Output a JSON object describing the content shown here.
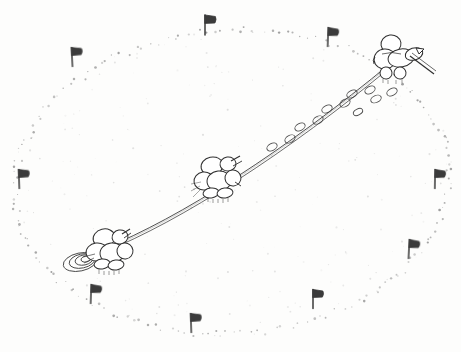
{
  "image": {
    "kind": "hand-drawn-pencil-sketch",
    "title": "Three figures hauling a tow-line across a flagged oval course",
    "medium": "graphite pencil on white paper",
    "background_color": "#fdfdfc",
    "ink_color": "#2a2a2a",
    "faint_color": "#9a9a9a",
    "width": 461,
    "height": 352,
    "orientation": "landscape"
  },
  "scene": {
    "description": "A large dotted ellipse marks out a ground course. Three small rounded humanoid figures are strung along a single taut double-line rope running from the lower-left to the upper-right. Small flag markers shaped like the letter P ring the ellipse. Oval footprints trail behind the leading figure.",
    "caption": "Three roped figures crossing a flag-marked oval",
    "perspective": "high oblique / bird's eye"
  },
  "course": {
    "name": "dotted-ellipse-course",
    "style": "stippled dotted outline",
    "center": {
      "x": 232,
      "y": 182
    },
    "radius_x": 218,
    "radius_y": 152,
    "rotation_deg": -4,
    "dot_count": 168,
    "dot_color": "#8d8d8d"
  },
  "flags": {
    "label": "course marker flags",
    "glyph": "P",
    "shape": "pole-with-pennant",
    "count": 9,
    "color": "#3a3a3a",
    "items": [
      {
        "id": "flag-top-left",
        "x": 72,
        "y": 57,
        "size": 19,
        "tilt": -3
      },
      {
        "id": "flag-top-center",
        "x": 205,
        "y": 25,
        "size": 20,
        "tilt": 0
      },
      {
        "id": "flag-top-right",
        "x": 328,
        "y": 37,
        "size": 19,
        "tilt": 2
      },
      {
        "id": "flag-left",
        "x": 19,
        "y": 179,
        "size": 19,
        "tilt": -2
      },
      {
        "id": "flag-right",
        "x": 435,
        "y": 179,
        "size": 19,
        "tilt": 1
      },
      {
        "id": "flag-lower-right",
        "x": 409,
        "y": 249,
        "size": 19,
        "tilt": 3
      },
      {
        "id": "flag-bottom-right",
        "x": 313,
        "y": 299,
        "size": 19,
        "tilt": 0
      },
      {
        "id": "flag-bottom-center",
        "x": 191,
        "y": 323,
        "size": 19,
        "tilt": -2
      },
      {
        "id": "flag-bottom-left",
        "x": 91,
        "y": 294,
        "size": 19,
        "tilt": 2
      }
    ]
  },
  "towline": {
    "label": "tow rope",
    "style": "double pencil line, taut",
    "from": {
      "x": 103,
      "y": 248
    },
    "to": {
      "x": 390,
      "y": 62
    },
    "color": "#3d3d3d"
  },
  "figures": {
    "label": "roped figures",
    "count": 3,
    "items": [
      {
        "id": "figure-lead",
        "position_label": "upper-right",
        "x": 392,
        "y": 60,
        "scale": 1.0,
        "holds": "long pole",
        "note": "leading figure, carries a long pole angled down-right"
      },
      {
        "id": "figure-middle",
        "position_label": "center",
        "x": 216,
        "y": 180,
        "scale": 1.0,
        "holds": "rope",
        "note": "middle figure clipped onto the tow-line"
      },
      {
        "id": "figure-trailing",
        "position_label": "lower-left",
        "x": 106,
        "y": 250,
        "scale": 1.0,
        "holds": "rope",
        "note": "trailing figure with a round disc or sled at its left"
      }
    ]
  },
  "footprints": {
    "label": "oval footprint trail",
    "count": 11,
    "color": "#4a4a4a",
    "items": [
      {
        "x": 272,
        "y": 147,
        "w": 11,
        "h": 7,
        "rot": -28
      },
      {
        "x": 290,
        "y": 139,
        "w": 11,
        "h": 7,
        "rot": -30
      },
      {
        "x": 300,
        "y": 127,
        "w": 11,
        "h": 7,
        "rot": -28
      },
      {
        "x": 318,
        "y": 120,
        "w": 11,
        "h": 7,
        "rot": -30
      },
      {
        "x": 327,
        "y": 109,
        "w": 11,
        "h": 7,
        "rot": -26
      },
      {
        "x": 345,
        "y": 103,
        "w": 11,
        "h": 7,
        "rot": -30
      },
      {
        "x": 352,
        "y": 94,
        "w": 11,
        "h": 7,
        "rot": -26
      },
      {
        "x": 370,
        "y": 90,
        "w": 11,
        "h": 7,
        "rot": -28
      },
      {
        "x": 376,
        "y": 99,
        "w": 11,
        "h": 7,
        "rot": -24
      },
      {
        "x": 392,
        "y": 92,
        "w": 11,
        "h": 7,
        "rot": -26
      },
      {
        "x": 358,
        "y": 112,
        "w": 10,
        "h": 6,
        "rot": -28
      }
    ]
  },
  "disc": {
    "label": "round sled disc",
    "x": 80,
    "y": 262,
    "rings": 4,
    "note": "concentric ovals beside the trailing figure"
  },
  "speckle": {
    "label": "graphite speckle",
    "count": 220,
    "color": "#b4b4b4"
  }
}
